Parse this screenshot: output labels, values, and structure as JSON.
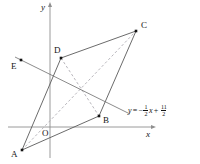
{
  "figure": {
    "type": "coordinate-geometry-diagram",
    "background_color": "#ffffff",
    "ink_color": "#141414",
    "axis_color": "#8f8f8f",
    "solid_color": "#5a5a5a",
    "dashed_color": "#b0aeb4",
    "width": 200,
    "height": 164
  },
  "axes": {
    "x_label": "x",
    "y_label": "y",
    "origin_label": "O",
    "x_axis": {
      "x1": 8,
      "y1": 127,
      "x2": 152,
      "y2": 127
    },
    "y_axis": {
      "x1": 50,
      "y1": 158,
      "x2": 50,
      "y2": 6
    },
    "x_label_pos": {
      "x": 146,
      "y": 130
    },
    "y_label_pos": {
      "x": 41,
      "y": 3
    },
    "origin_label_pos": {
      "x": 42,
      "y": 129
    }
  },
  "points": [
    {
      "name": "A",
      "dot": {
        "x": 22,
        "y": 150
      },
      "label": "A",
      "label_pos": {
        "x": 11,
        "y": 150
      }
    },
    {
      "name": "B",
      "dot": {
        "x": 99,
        "y": 116
      },
      "label": "B",
      "label_pos": {
        "x": 103,
        "y": 116
      }
    },
    {
      "name": "C",
      "dot": {
        "x": 136,
        "y": 31
      },
      "label": "C",
      "label_pos": {
        "x": 141,
        "y": 21
      }
    },
    {
      "name": "D",
      "dot": {
        "x": 61,
        "y": 58
      },
      "label": "D",
      "label_pos": {
        "x": 54,
        "y": 46
      }
    },
    {
      "name": "E",
      "dot": {
        "x": 21,
        "y": 60
      },
      "label": "E",
      "label_pos": {
        "x": 11,
        "y": 62
      }
    }
  ],
  "solid_segments": [
    {
      "name": "segment-A-D",
      "from": "A",
      "to": "D"
    },
    {
      "name": "segment-D-C",
      "from": "D",
      "to": "C"
    },
    {
      "name": "segment-C-B",
      "from": "C",
      "to": "B"
    },
    {
      "name": "segment-B-A",
      "from": "B",
      "to": "A"
    }
  ],
  "dashed_segments": [
    {
      "name": "diagonal-A-C",
      "from": "A",
      "to": "C"
    },
    {
      "name": "diagonal-D-B",
      "from": "D",
      "to": "B"
    }
  ],
  "line": {
    "name": "line-through-E",
    "slope": -0.5,
    "intercept": 5.5,
    "endpoints": {
      "x1": 15,
      "y1": 57,
      "x2": 130,
      "y2": 114
    },
    "equation": {
      "lhs": "y",
      "equals": "=",
      "minus": "−",
      "slope_num": "1",
      "slope_den": "2",
      "variable": "x",
      "plus": "+",
      "intercept_num": "11",
      "intercept_den": "2",
      "plain": "y = -1/2 x + 11/2"
    },
    "equation_pos": {
      "x": 128,
      "y": 104
    }
  }
}
